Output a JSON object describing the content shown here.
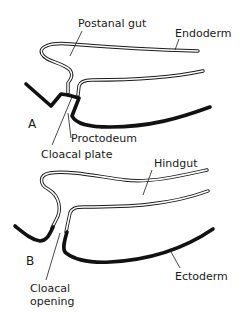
{
  "figure": {
    "panels": [
      {
        "id": "A",
        "label": "A",
        "annotations": {
          "postanal_gut": "Postanal gut",
          "endoderm": "Endoderm",
          "proctodeum": "Proctodeum",
          "cloacal_plate": "Cloacal plate"
        }
      },
      {
        "id": "B",
        "label": "B",
        "annotations": {
          "hindgut": "Hindgut",
          "ectoderm": "Ectoderm",
          "cloacal_opening_line1": "Cloacal",
          "cloacal_opening_line2": "opening"
        }
      }
    ],
    "colors": {
      "line": "#1a1a1a",
      "background": "#ffffff"
    }
  }
}
